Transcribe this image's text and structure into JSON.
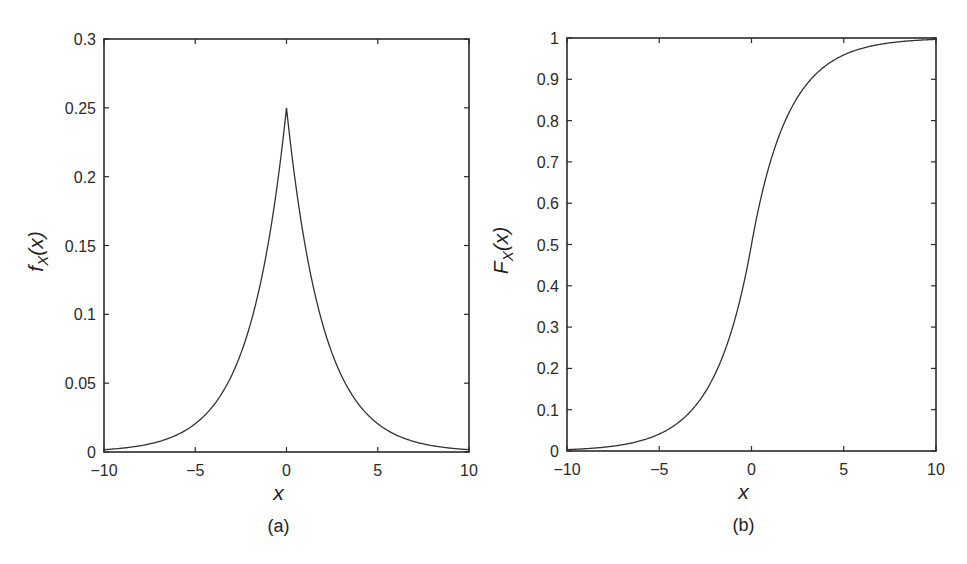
{
  "chart_data": [
    {
      "id": "a",
      "type": "line",
      "panel_label": "(a)",
      "title": "",
      "xlabel": "x",
      "ylabel": "f_X(x)",
      "ylabel_main": "f",
      "ylabel_sub": "X",
      "ylabel_arg": "(x)",
      "xlim": [
        -10,
        10
      ],
      "ylim": [
        0,
        0.3
      ],
      "xticks": [
        -10,
        -5,
        0,
        5,
        10
      ],
      "xtick_labels": [
        "−10",
        "−5",
        "0",
        "5",
        "10"
      ],
      "yticks": [
        0,
        0.05,
        0.1,
        0.15,
        0.2,
        0.25,
        0.3
      ],
      "ytick_labels": [
        "0",
        "0.05",
        "0.1",
        "0.15",
        "0.2",
        "0.25",
        "0.3"
      ],
      "grid": false,
      "legend": null,
      "description": "Laplace PDF, peak 0.25 at x=0",
      "series": [
        {
          "name": "f_X(x)",
          "x": [
            -10,
            -9,
            -8,
            -7,
            -6,
            -5,
            -4,
            -3,
            -2,
            -1.5,
            -1,
            -0.5,
            0,
            0.5,
            1,
            1.5,
            2,
            3,
            4,
            5,
            6,
            7,
            8,
            9,
            10
          ],
          "y": [
            0.0017,
            0.0028,
            0.0046,
            0.0076,
            0.0124,
            0.0205,
            0.0338,
            0.0558,
            0.092,
            0.1181,
            0.1516,
            0.1947,
            0.25,
            0.1947,
            0.1516,
            0.1181,
            0.092,
            0.0558,
            0.0338,
            0.0205,
            0.0124,
            0.0076,
            0.0046,
            0.0028,
            0.0017
          ]
        }
      ]
    },
    {
      "id": "b",
      "type": "line",
      "panel_label": "(b)",
      "title": "",
      "xlabel": "x",
      "ylabel": "F_X(x)",
      "ylabel_main": "F",
      "ylabel_sub": "X",
      "ylabel_arg": "(x)",
      "xlim": [
        -10,
        10
      ],
      "ylim": [
        0,
        1
      ],
      "xticks": [
        -10,
        -5,
        0,
        5,
        10
      ],
      "xtick_labels": [
        "−10",
        "−5",
        "0",
        "5",
        "10"
      ],
      "yticks": [
        0,
        0.1,
        0.2,
        0.3,
        0.4,
        0.5,
        0.6,
        0.7,
        0.8,
        0.9,
        1
      ],
      "ytick_labels": [
        "0",
        "0.1",
        "0.2",
        "0.3",
        "0.4",
        "0.5",
        "0.6",
        "0.7",
        "0.8",
        "0.9",
        "1"
      ],
      "grid": false,
      "legend": null,
      "description": "Laplace CDF, 0.5 at x=0",
      "series": [
        {
          "name": "F_X(x)",
          "x": [
            -10,
            -9,
            -8,
            -7,
            -6,
            -5,
            -4,
            -3,
            -2,
            -1.5,
            -1,
            -0.5,
            0,
            0.5,
            1,
            1.5,
            2,
            3,
            4,
            5,
            6,
            7,
            8,
            9,
            10
          ],
          "y": [
            0.0034,
            0.0056,
            0.0092,
            0.0151,
            0.0249,
            0.041,
            0.0677,
            0.1116,
            0.1839,
            0.2362,
            0.3033,
            0.3894,
            0.5,
            0.6106,
            0.6967,
            0.7638,
            0.8161,
            0.8884,
            0.9323,
            0.959,
            0.9751,
            0.9849,
            0.9908,
            0.9944,
            0.9966
          ]
        }
      ]
    }
  ],
  "layout": {
    "panels": [
      {
        "left": 104,
        "top": 39,
        "right": 469,
        "bottom": 452
      },
      {
        "left": 567,
        "top": 38,
        "right": 936,
        "bottom": 451
      }
    ]
  }
}
